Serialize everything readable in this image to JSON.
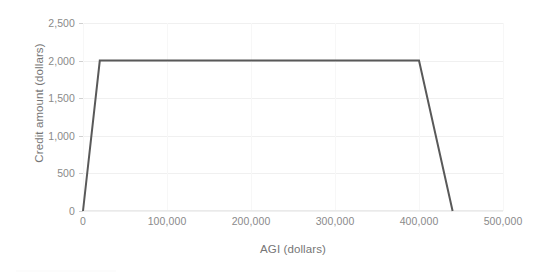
{
  "chart_data": {
    "type": "line",
    "title": "",
    "xlabel": "AGI (dollars)",
    "ylabel": "Credit amount (dollars)",
    "xlim": [
      0,
      500000
    ],
    "ylim": [
      0,
      2500
    ],
    "grid": true,
    "legend": "none",
    "x_ticks": [
      0,
      100000,
      200000,
      300000,
      400000,
      500000
    ],
    "x_tick_labels": [
      "0",
      "100,000",
      "200,000",
      "300,000",
      "400,000",
      "500,000"
    ],
    "y_ticks": [
      0,
      500,
      1000,
      1500,
      2000,
      2500
    ],
    "y_tick_labels": [
      "0",
      "500",
      "1,000",
      "1,500",
      "2,000",
      "2,500"
    ],
    "line_color": "#595959",
    "line_width": 2,
    "series": [
      {
        "name": "Credit amount",
        "x": [
          0,
          20000,
          400000,
          440000
        ],
        "values": [
          0,
          2000,
          2000,
          0
        ]
      }
    ]
  }
}
